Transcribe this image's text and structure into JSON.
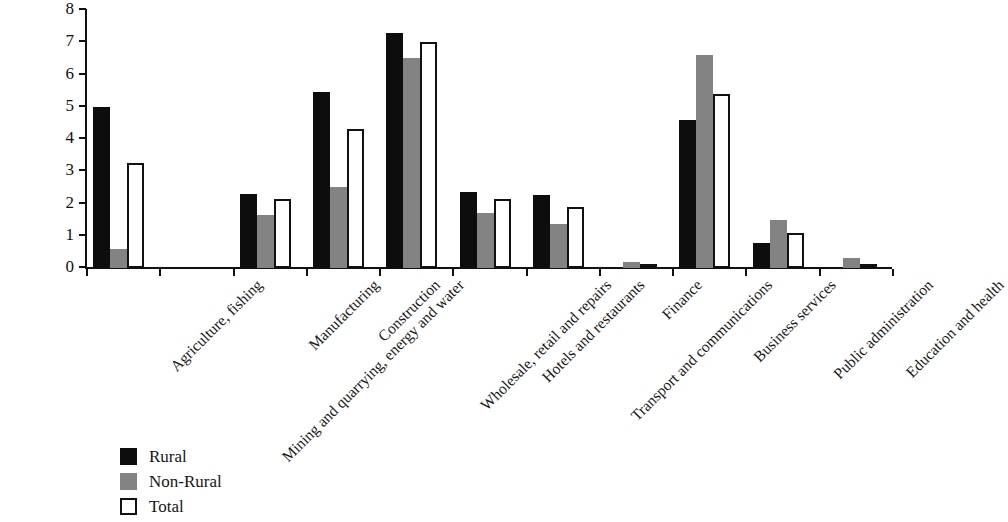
{
  "chart_data": {
    "type": "bar",
    "title": "",
    "xlabel": "",
    "ylabel": "",
    "ylim": [
      0,
      8
    ],
    "yticks": [
      0,
      1,
      2,
      3,
      4,
      5,
      6,
      7,
      8
    ],
    "ytick_labels": [
      "0",
      "1",
      "2",
      "3",
      "4",
      "5",
      "6",
      "7",
      "8"
    ],
    "grid": false,
    "legend_position": "bottom-left",
    "categories": [
      "Agriculture, fishing",
      "Mining and quarrying, energy and water",
      "Manufacturing",
      "Construction",
      "Wholesale, retail and repairs",
      "Hotels and restaurants",
      "Transport and communications",
      "Finance",
      "Business services",
      "Public administration",
      "Education and health"
    ],
    "series": [
      {
        "name": "Rural",
        "color": "#0d0d0d",
        "values": [
          5.0,
          0.0,
          2.3,
          5.45,
          7.3,
          2.35,
          2.25,
          0.0,
          4.6,
          0.78,
          0.0
        ]
      },
      {
        "name": "Non-Rural",
        "color": "#838383",
        "values": [
          0.6,
          0.0,
          1.65,
          2.5,
          6.5,
          1.7,
          1.35,
          0.18,
          6.6,
          1.48,
          0.3
        ]
      },
      {
        "name": "Total",
        "color": "#ffffff",
        "values": [
          3.25,
          0.0,
          2.15,
          4.3,
          7.0,
          2.15,
          1.9,
          0.1,
          5.4,
          1.08,
          0.1
        ]
      }
    ]
  },
  "legend": {
    "items": [
      {
        "label": "Rural",
        "swatch": "rural"
      },
      {
        "label": "Non-Rural",
        "swatch": "non-rural"
      },
      {
        "label": "Total",
        "swatch": "total"
      }
    ]
  }
}
